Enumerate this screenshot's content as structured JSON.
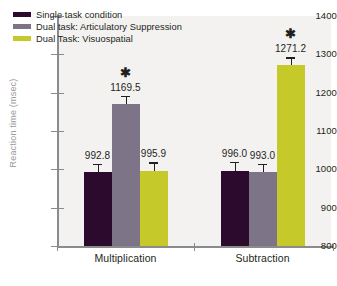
{
  "chart_data": {
    "type": "bar",
    "title": "",
    "subtitle": "",
    "xlabel": "",
    "ylabel": "Reaction time (msec)",
    "ylim": [
      800,
      1400
    ],
    "ytick_step": 100,
    "yticks": [
      800,
      900,
      1000,
      1100,
      1200,
      1300,
      1400
    ],
    "grid": false,
    "legend_position": "top-left-inside",
    "categories": [
      "Multiplication",
      "Subtraction"
    ],
    "series": [
      {
        "name": "Single task condition",
        "color": "#2b0a2e",
        "values": [
          992.8,
          996.0
        ],
        "value_labels": [
          "992.8",
          "996.0"
        ],
        "errors": [
          22,
          24
        ],
        "significant": [
          false,
          false
        ]
      },
      {
        "name": "Dual task: Articulatory Suppression",
        "color": "#7e7487",
        "values": [
          1169.5,
          993.0
        ],
        "value_labels": [
          "1169.5",
          "993.0"
        ],
        "errors": [
          22,
          22
        ],
        "significant": [
          true,
          false
        ]
      },
      {
        "name": "Dual Task: Visuospatial",
        "color": "#c5c92a",
        "values": [
          995.9,
          1271.2
        ],
        "value_labels": [
          "995.9",
          "1271.2"
        ],
        "errors": [
          22,
          21
        ],
        "significant": [
          false,
          true
        ]
      }
    ],
    "annotations": {
      "significance_marker": "✱"
    }
  },
  "legend": {
    "items": [
      {
        "label": "Single task condition",
        "color": "#2b0a2e"
      },
      {
        "label": "Dual task: Articulatory Suppression",
        "color": "#7e7487"
      },
      {
        "label": "Dual Task: Visuospatial",
        "color": "#c5c92a"
      }
    ]
  },
  "caption": {
    "text": ""
  }
}
